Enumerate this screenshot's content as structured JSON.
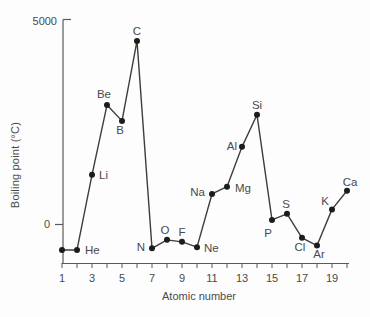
{
  "figure": {
    "colors": {
      "background": "#fdfdfd",
      "line": "#3d3d3d",
      "point": "#1c1c1c",
      "axis": "#5a5a5a",
      "text": "#4a4a4a"
    }
  },
  "chart_data": {
    "type": "line",
    "title": "",
    "xlabel": "Atomic number",
    "ylabel": "Boiling point (°C)",
    "x_range": [
      1,
      20
    ],
    "x_tick_step": 1,
    "x_tick_labels": [
      "1",
      "3",
      "5",
      "7",
      "9",
      "11",
      "13",
      "15",
      "17",
      "19"
    ],
    "x_labeled_ticks": [
      1,
      3,
      5,
      7,
      9,
      11,
      13,
      15,
      17,
      19
    ],
    "y_tick_labels": [
      "0",
      "5000"
    ],
    "y_ticks": [
      0,
      5000
    ],
    "ylim": [
      -960,
      5050
    ],
    "grid": false,
    "legend": false,
    "series_name": "Boiling point of elements 1-20",
    "points": [
      {
        "symbol": "H",
        "atomic_number": 1,
        "boiling_point_c": -640,
        "labeled": false
      },
      {
        "symbol": "He",
        "atomic_number": 2,
        "boiling_point_c": -640,
        "labeled": true
      },
      {
        "symbol": "Li",
        "atomic_number": 3,
        "boiling_point_c": 1210,
        "labeled": true
      },
      {
        "symbol": "Be",
        "atomic_number": 4,
        "boiling_point_c": 2930,
        "labeled": true
      },
      {
        "symbol": "B",
        "atomic_number": 5,
        "boiling_point_c": 2540,
        "labeled": true
      },
      {
        "symbol": "C",
        "atomic_number": 6,
        "boiling_point_c": 4510,
        "labeled": true
      },
      {
        "symbol": "N",
        "atomic_number": 7,
        "boiling_point_c": -600,
        "labeled": true
      },
      {
        "symbol": "O",
        "atomic_number": 8,
        "boiling_point_c": -390,
        "labeled": true
      },
      {
        "symbol": "F",
        "atomic_number": 9,
        "boiling_point_c": -440,
        "labeled": true
      },
      {
        "symbol": "Ne",
        "atomic_number": 10,
        "boiling_point_c": -570,
        "labeled": true
      },
      {
        "symbol": "Na",
        "atomic_number": 11,
        "boiling_point_c": 740,
        "labeled": true
      },
      {
        "symbol": "Mg",
        "atomic_number": 12,
        "boiling_point_c": 920,
        "labeled": true
      },
      {
        "symbol": "Al",
        "atomic_number": 13,
        "boiling_point_c": 1900,
        "labeled": true
      },
      {
        "symbol": "Si",
        "atomic_number": 14,
        "boiling_point_c": 2690,
        "labeled": true
      },
      {
        "symbol": "P",
        "atomic_number": 15,
        "boiling_point_c": 100,
        "labeled": true
      },
      {
        "symbol": "S",
        "atomic_number": 16,
        "boiling_point_c": 250,
        "labeled": true
      },
      {
        "symbol": "Cl",
        "atomic_number": 17,
        "boiling_point_c": -340,
        "labeled": true
      },
      {
        "symbol": "Ar",
        "atomic_number": 18,
        "boiling_point_c": -530,
        "labeled": true
      },
      {
        "symbol": "K",
        "atomic_number": 19,
        "boiling_point_c": 360,
        "labeled": true
      },
      {
        "symbol": "Ca",
        "atomic_number": 20,
        "boiling_point_c": 820,
        "labeled": true
      }
    ]
  }
}
